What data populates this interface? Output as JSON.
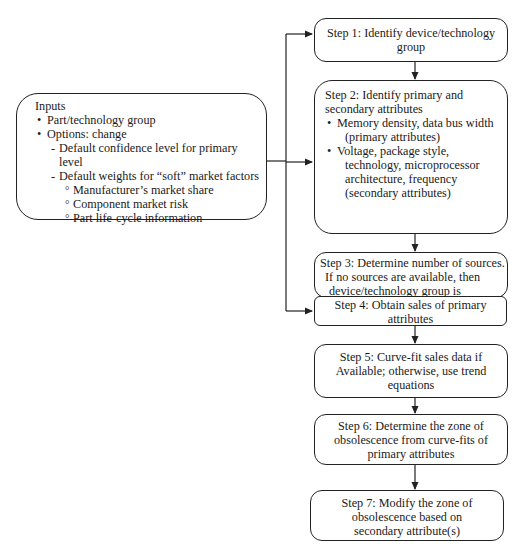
{
  "inputs": {
    "title": "Inputs",
    "bullets": [
      "Part/technology group",
      "Options: change"
    ],
    "dashes": [
      "Default confidence level for primary level",
      "Default weights for “soft” market factors"
    ],
    "subitems": [
      "Manufacturer’s market share",
      "Component market risk",
      "Part life-cycle information"
    ]
  },
  "steps": {
    "step1": {
      "line1": "Step 1: Identify device/technology",
      "line2": "group"
    },
    "step2": {
      "line1": "Step 2: Identify primary and",
      "line2": "secondary attributes",
      "bullet1_a": "Memory density, data bus width",
      "bullet1_b": "(primary attributes)",
      "bullet2_a": "Voltage, package style,",
      "bullet2_b": "technology, microprocessor",
      "bullet2_c": "architecture, frequency",
      "bullet2_d": "(secondary attributes)"
    },
    "step3": {
      "line1": "Step 3: Determine number of sources.",
      "line2": "If no sources are available, then",
      "line3": "device/technology group is obsolete."
    },
    "step4": {
      "line1": "Step 4: Obtain sales of primary",
      "line2": "attributes"
    },
    "step5": {
      "line1": "Step 5: Curve-fit sales data if",
      "line2": "Available; otherwise, use trend",
      "line3": "equations"
    },
    "step6": {
      "line1": "Step 6: Determine the zone of",
      "line2": "obsolescence from curve-fits of",
      "line3": "primary attributes"
    },
    "step7": {
      "line1": "Step 7: Modify the zone of",
      "line2": "obsolescence based on",
      "line3": "secondary attribute(s)"
    }
  },
  "colors": {
    "line": "#222222",
    "background": "#ffffff",
    "text": "#1a1a1a"
  }
}
